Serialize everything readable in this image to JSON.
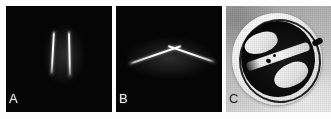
{
  "figure": {
    "background_color": "#ffffff",
    "panel_count": 3
  },
  "panels": [
    {
      "id": "A",
      "label": "A",
      "label_color": "#e9e9e9",
      "background_color": "#050505",
      "type": "radiographic-image",
      "description": "Dark field with two bright near-vertical linear structures",
      "features": [
        {
          "name": "left-streak",
          "orientation": "near-vertical",
          "tilt_degrees": 3
        },
        {
          "name": "right-streak",
          "orientation": "near-vertical",
          "tilt_degrees": -1
        }
      ]
    },
    {
      "id": "B",
      "label": "B",
      "label_color": "#e9e9e9",
      "background_color": "#050505",
      "type": "radiographic-image",
      "description": "Dark field with a single bright chevron / inverted-V structure",
      "features": [
        {
          "name": "left-arm",
          "orientation": "diagonal",
          "tilt_degrees": -19
        },
        {
          "name": "right-arm",
          "orientation": "diagonal",
          "tilt_degrees": 19
        }
      ]
    },
    {
      "id": "C",
      "label": "C",
      "label_color": "#171717",
      "background_color": "#c9c9c9",
      "type": "photograph",
      "description": "Photograph of an oval mechanical valve prosthesis with a light sewing ring and dark central body",
      "features": [
        {
          "name": "sewing-cuff",
          "color": "#f6f6f6"
        },
        {
          "name": "valve-body",
          "color": "#0b0b0b"
        },
        {
          "name": "leaflet-band",
          "color": "#fafafa"
        },
        {
          "name": "ring-tab",
          "color": "#0d0d0d"
        }
      ]
    }
  ]
}
